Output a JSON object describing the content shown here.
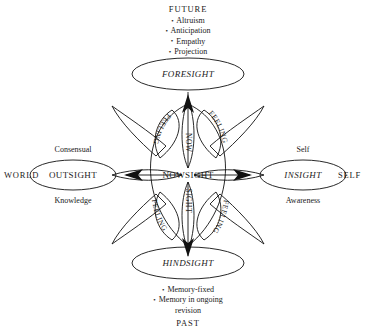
{
  "diagram": {
    "title_future": "FUTURE",
    "title_past": "PAST",
    "world_label": "WORLD",
    "self_label": "SELF",
    "center": {
      "name": "NOWSIGHT",
      "vertical_top": "NOW",
      "vertical_bottom": "SIGHT",
      "arc_label": "FEELING",
      "arc_count": 4
    },
    "nodes": {
      "foresight": "FORESIGHT",
      "hindsight": "HINDSIGHT",
      "outsight": "OUTSIGHT",
      "insight": "INSIGHT"
    },
    "future_bullets": [
      "Altruism",
      "Anticipation",
      "Empathy",
      "Projection"
    ],
    "past_bullets": [
      "Memory-fixed",
      "Memory in ongoing",
      "revision"
    ],
    "outsight_above": "Consensual",
    "outsight_below": "Knowledge",
    "insight_above": "Self",
    "insight_below": "Awareness",
    "bullet_glyph": "•",
    "colors": {
      "ink": "#1a1a1a",
      "stroke": "#111111",
      "background": "#ffffff"
    }
  }
}
